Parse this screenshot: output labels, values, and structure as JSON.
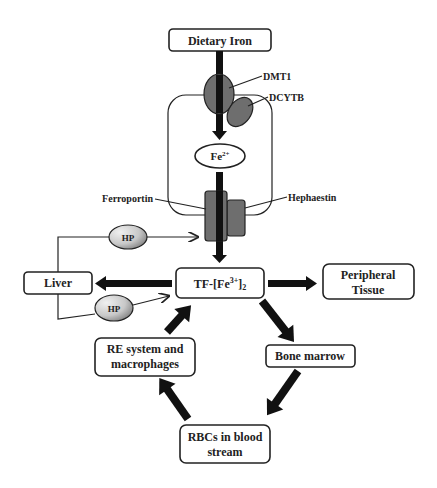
{
  "diagram": {
    "nodes": {
      "dietary_iron": "Dietary Iron",
      "fe2": "Fe",
      "fe2_sup": "2+",
      "tf_prefix": "TF-[Fe",
      "tf_sup": "3+",
      "tf_suffix": "]",
      "tf_sub": "2",
      "liver": "Liver",
      "peripheral_line1": "Peripheral",
      "peripheral_line2": "Tissue",
      "bone_marrow": "Bone marrow",
      "re_line1": "RE system and",
      "re_line2": "macrophages",
      "rbc_line1": "RBCs in blood",
      "rbc_line2": "stream"
    },
    "proteins": {
      "dmt1": "DMT1",
      "dcytb": "DCYTB",
      "ferroportin": "Ferroportin",
      "hephaestin": "Hephaestin",
      "hp_top": "HP",
      "hp_bottom": "HP"
    },
    "edges": [
      {
        "from": "Dietary Iron",
        "to": "Fe2+",
        "via": "DMT1"
      },
      {
        "from": "Fe2+",
        "to": "TF-[Fe3+]2",
        "via": "Ferroportin"
      },
      {
        "from": "Liver",
        "to": "Ferroportin",
        "via": "HP"
      },
      {
        "from": "Liver",
        "to": "TF-[Fe3+]2",
        "via": "HP"
      },
      {
        "from": "TF-[Fe3+]2",
        "to": "Liver"
      },
      {
        "from": "TF-[Fe3+]2",
        "to": "Peripheral Tissue"
      },
      {
        "from": "TF-[Fe3+]2",
        "to": "Bone marrow"
      },
      {
        "from": "Bone marrow",
        "to": "RBCs in blood stream"
      },
      {
        "from": "RBCs in blood stream",
        "to": "RE system and macrophages"
      },
      {
        "from": "RE system and macrophages",
        "to": "TF-[Fe3+]2"
      }
    ],
    "colors": {
      "protein_fill": "#6e6e6e",
      "hp_gradient_dark": "#7a7a7a",
      "hp_gradient_light": "#eeeeee",
      "stroke": "#222222"
    }
  }
}
